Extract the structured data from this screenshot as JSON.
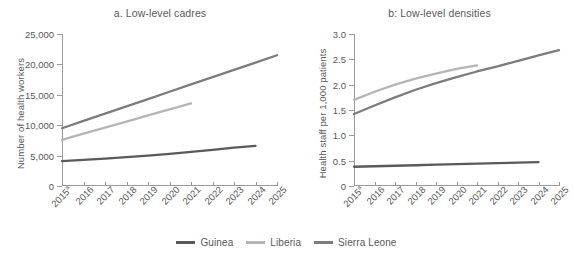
{
  "figure": {
    "legend": {
      "items": [
        {
          "label": "Guinea",
          "color": "#5a5a5a"
        },
        {
          "label": "Liberia",
          "color": "#b5b5b5"
        },
        {
          "label": "Sierra Leone",
          "color": "#7c7c7c"
        }
      ]
    }
  },
  "chart_data": [
    {
      "type": "line",
      "title": "a. Low-level cadres",
      "xlabel": "",
      "ylabel": "Number of health workers",
      "ylim": [
        0,
        25000
      ],
      "yticks": [
        0,
        5000,
        10000,
        15000,
        20000,
        25000
      ],
      "ytick_labels": [
        "0",
        "5,000",
        "10,000",
        "15,000",
        "20,000",
        "25,000"
      ],
      "x": [
        2015,
        2016,
        2017,
        2018,
        2019,
        2020,
        2021,
        2022,
        2023,
        2024,
        2025
      ],
      "xtick_labels": [
        "2015a",
        "2016",
        "2017",
        "2018",
        "2019",
        "2020",
        "2021",
        "2022",
        "2023",
        "2024",
        "2025"
      ],
      "xtick_first_base": "2015",
      "xtick_first_sup": "a",
      "grid": false,
      "legend_position": "bottom-center",
      "series": [
        {
          "name": "Guinea",
          "color": "#5a5a5a",
          "x": [
            2015,
            2016,
            2017,
            2018,
            2019,
            2020,
            2021,
            2022,
            2023,
            2024
          ],
          "values": [
            4100,
            4300,
            4500,
            4750,
            5000,
            5300,
            5600,
            5950,
            6300,
            6600
          ]
        },
        {
          "name": "Liberia",
          "color": "#b5b5b5",
          "x": [
            2015,
            2016,
            2017,
            2018,
            2019,
            2020,
            2021
          ],
          "values": [
            7600,
            8600,
            9600,
            10600,
            11600,
            12600,
            13600
          ]
        },
        {
          "name": "Sierra Leone",
          "color": "#7c7c7c",
          "x": [
            2015,
            2016,
            2017,
            2018,
            2019,
            2020,
            2021,
            2022,
            2023,
            2024,
            2025
          ],
          "values": [
            9500,
            10700,
            11900,
            13100,
            14300,
            15500,
            16700,
            17900,
            19100,
            20300,
            21500
          ]
        }
      ]
    },
    {
      "type": "line",
      "title": "b: Low-level densities",
      "xlabel": "",
      "ylabel": "Health staff  per 1,000 patients",
      "ylim": [
        0,
        3.0
      ],
      "yticks": [
        0,
        0.5,
        1.0,
        1.5,
        2.0,
        2.5,
        3.0
      ],
      "ytick_labels": [
        "0",
        "0.5",
        "1.0",
        "1.5",
        "2.0",
        "2.5",
        "3.0"
      ],
      "x": [
        2015,
        2016,
        2017,
        2018,
        2019,
        2020,
        2021,
        2022,
        2023,
        2024,
        2025
      ],
      "xtick_labels": [
        "2015a",
        "2016",
        "2017",
        "2018",
        "2019",
        "2020",
        "2021",
        "2022",
        "2023",
        "2024",
        "2025"
      ],
      "xtick_first_base": "2015",
      "xtick_first_sup": "a",
      "grid": false,
      "legend_position": "bottom-center",
      "series": [
        {
          "name": "Guinea",
          "color": "#5a5a5a",
          "x": [
            2015,
            2016,
            2017,
            2018,
            2019,
            2020,
            2021,
            2022,
            2023,
            2024
          ],
          "values": [
            0.38,
            0.39,
            0.4,
            0.41,
            0.42,
            0.43,
            0.44,
            0.45,
            0.46,
            0.47
          ]
        },
        {
          "name": "Liberia",
          "color": "#b5b5b5",
          "x": [
            2015,
            2016,
            2017,
            2018,
            2019,
            2020,
            2021
          ],
          "values": [
            1.7,
            1.86,
            2.0,
            2.12,
            2.22,
            2.31,
            2.38
          ]
        },
        {
          "name": "Sierra Leone",
          "color": "#7c7c7c",
          "x": [
            2015,
            2016,
            2017,
            2018,
            2019,
            2020,
            2021,
            2022,
            2023,
            2024,
            2025
          ],
          "values": [
            1.42,
            1.59,
            1.75,
            1.9,
            2.03,
            2.15,
            2.26,
            2.36,
            2.47,
            2.58,
            2.68
          ]
        }
      ]
    }
  ]
}
